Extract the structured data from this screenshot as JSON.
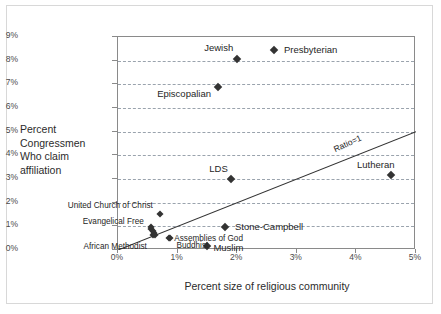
{
  "chart_data": {
    "type": "scatter",
    "title": "",
    "xlabel": "Percent size of religious community",
    "ylabel_lines": [
      "Percent",
      "Congressmen",
      "Who claim",
      "affiliation"
    ],
    "xlim": [
      0,
      5
    ],
    "ylim": [
      0,
      9
    ],
    "xticks": [
      "0%",
      "1%",
      "2%",
      "3%",
      "4%",
      "5%"
    ],
    "xtick_values": [
      0,
      1,
      2,
      3,
      4,
      5
    ],
    "yticks": [
      "0%",
      "1%",
      "2%",
      "3%",
      "4%",
      "5%",
      "6%",
      "7%",
      "8%",
      "9%"
    ],
    "ytick_values": [
      0,
      1,
      2,
      3,
      4,
      5,
      6,
      7,
      8,
      9
    ],
    "grid": "horizontal-dashed",
    "legend": "none",
    "reference_line": {
      "label": "Ratio=1",
      "from": [
        0,
        0
      ],
      "to": [
        5,
        5
      ],
      "style": "solid"
    },
    "points": [
      {
        "name": "Jewish",
        "x": 2.0,
        "y": 8.05,
        "label_dx": -4,
        "label_dy": -11,
        "label_anchor": "end",
        "size": "big"
      },
      {
        "name": "Episcopalian",
        "x": 1.68,
        "y": 6.9,
        "label_dx": -7,
        "label_dy": 7,
        "label_anchor": "end",
        "size": "big"
      },
      {
        "name": "LDS",
        "x": 1.9,
        "y": 3.0,
        "label_dx": -4,
        "label_dy": -10,
        "label_anchor": "end",
        "size": "big"
      },
      {
        "name": "Lutheran",
        "x": 4.58,
        "y": 3.18,
        "label_dx": 4,
        "label_dy": -10,
        "label_anchor": "end",
        "size": "big"
      },
      {
        "name": "United Church of Christ",
        "x": 0.7,
        "y": 1.52,
        "label_dx": -7,
        "label_dy": -7,
        "label_anchor": "end",
        "size": "small"
      },
      {
        "name": "Evangelical Free",
        "x": 0.55,
        "y": 0.98,
        "label_dx": -7,
        "label_dy": -4,
        "label_anchor": "end",
        "size": "small"
      },
      {
        "name": "African Methodist",
        "x": 0.58,
        "y": 0.62,
        "label_dx": -6,
        "label_dy": 13,
        "label_anchor": "end",
        "size": "small"
      },
      {
        "name": "Assemblies of God",
        "x": 0.86,
        "y": 0.52,
        "label_dx": 5,
        "label_dy": 2,
        "label_anchor": "start",
        "size": "small"
      },
      {
        "name": "Buddhist",
        "x": 0.88,
        "y": 0.5,
        "label_dx": 6,
        "label_dy": 9,
        "label_anchor": "start",
        "size": "small"
      },
      {
        "name": "Muslim",
        "x": 1.5,
        "y": 0.18,
        "label_dx": 6,
        "label_dy": 2,
        "label_anchor": "start",
        "size": "big"
      }
    ],
    "cluster_extra": [
      {
        "x": 0.56,
        "y": 0.9
      },
      {
        "x": 0.58,
        "y": 0.8
      },
      {
        "x": 0.6,
        "y": 0.72
      },
      {
        "x": 0.62,
        "y": 0.64
      }
    ],
    "inline_legend_entries": [
      {
        "name": "Presbyterian",
        "x_px": 264,
        "y_px": 43
      },
      {
        "name": "Stone-Campbell",
        "x_px": 215,
        "y_px": 220
      }
    ]
  }
}
